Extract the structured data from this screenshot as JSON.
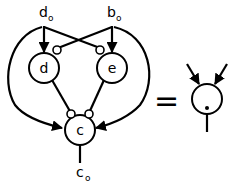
{
  "diagram": {
    "inputs": [
      {
        "id": "d0",
        "label": "d",
        "subscript": "o"
      },
      {
        "id": "b0",
        "label": "b",
        "subscript": "o"
      }
    ],
    "nodes": [
      {
        "id": "d",
        "label": "d"
      },
      {
        "id": "e",
        "label": "e"
      },
      {
        "id": "c",
        "label": "c"
      }
    ],
    "output": {
      "id": "c0",
      "label": "c",
      "subscript": "o"
    },
    "equals": "=",
    "edges": [
      {
        "from": "d0",
        "to": "d",
        "type": "excitatory"
      },
      {
        "from": "d0",
        "to": "e",
        "type": "inhibitory"
      },
      {
        "from": "b0",
        "to": "e",
        "type": "excitatory"
      },
      {
        "from": "b0",
        "to": "d",
        "type": "inhibitory"
      },
      {
        "from": "d0",
        "to": "c",
        "type": "excitatory"
      },
      {
        "from": "b0",
        "to": "c",
        "type": "excitatory"
      },
      {
        "from": "d",
        "to": "c",
        "type": "inhibitory"
      },
      {
        "from": "e",
        "to": "c",
        "type": "inhibitory"
      },
      {
        "from": "c",
        "to": "c0",
        "type": "output"
      }
    ],
    "equivalent": {
      "node": "xor-neuron",
      "inputs": 2,
      "type": "excitatory",
      "threshold_marker": "dot"
    }
  }
}
